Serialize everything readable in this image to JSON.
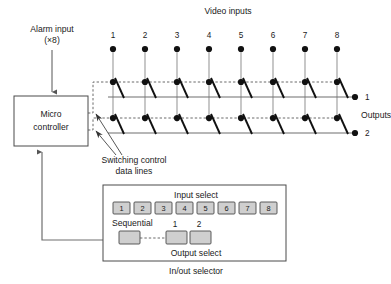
{
  "labels": {
    "video_inputs": "Video inputs",
    "alarm_input_line1": "Alarm input",
    "alarm_input_line2": "(×8)",
    "micro_line1": "Micro",
    "micro_line2": "controller",
    "outputs": "Outputs",
    "switching_line1": "Switching control",
    "switching_line2": "data lines",
    "input_select": "Input select",
    "output_select": "Output select",
    "sequential": "Sequential",
    "inout_selector": "In/out selector"
  },
  "video_inputs": {
    "count": 8,
    "numbers": [
      "1",
      "2",
      "3",
      "4",
      "5",
      "6",
      "7",
      "8"
    ]
  },
  "outputs": {
    "count": 2,
    "numbers": [
      "1",
      "2"
    ]
  },
  "input_select_buttons": [
    "1",
    "2",
    "3",
    "4",
    "5",
    "6",
    "7",
    "8"
  ],
  "output_select_buttons": [
    "1",
    "2"
  ],
  "output_select_numbers": [
    "1",
    "2"
  ],
  "colors": {
    "background": "#ffffff",
    "text": "#1a1a1a",
    "wire": "#9a9a9a",
    "control_line": "#5a5a5a",
    "switch_lever": "#111111",
    "button_fill": "#cfcfcf",
    "box_stroke": "#4a4a4a"
  }
}
